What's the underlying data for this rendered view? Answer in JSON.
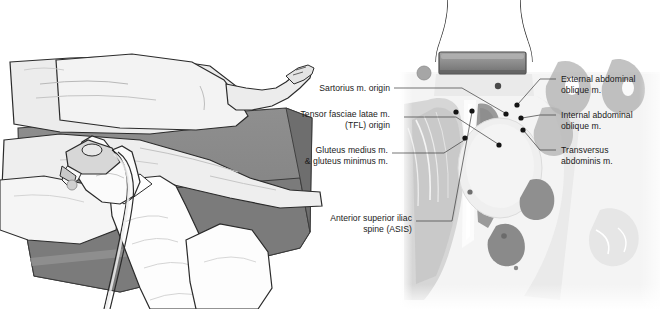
{
  "figure": {
    "background_color": "#ffffff",
    "panels": [
      {
        "id": "left-panel",
        "name": "patient-positioning-illustration",
        "description": "Line-art illustration of a clinician's hand holding an ultrasound transducer against the hip of a patient lying supine on an examination table"
      },
      {
        "id": "right-panel",
        "name": "anatomical-cross-section",
        "description": "Grayscale anatomical cross-section of the lower abdomen/pelvis with a transducer footprint placed on the skin surface"
      }
    ]
  },
  "labels_left": [
    {
      "id": "sartorius",
      "name": "label-sartorius-origin",
      "lines": [
        "Sartorius m. origin"
      ],
      "align": "right"
    },
    {
      "id": "tfl",
      "name": "label-tensor-fasciae-latae-origin",
      "lines": [
        "Tensor fasciae latae m.",
        "(TFL) origin"
      ],
      "align": "right"
    },
    {
      "id": "gluteus",
      "name": "label-gluteus-medius-minimus",
      "lines": [
        "Gluteus medius m.",
        "& gluteus minimus m."
      ],
      "align": "right"
    },
    {
      "id": "asis",
      "name": "label-anterior-superior-iliac-spine",
      "lines": [
        "Anterior superior iliac",
        "spine (ASIS)"
      ],
      "align": "right"
    }
  ],
  "labels_right": [
    {
      "id": "eo",
      "name": "label-external-abdominal-oblique",
      "lines": [
        "External abdominal",
        "oblique m."
      ],
      "align": "left"
    },
    {
      "id": "io",
      "name": "label-internal-abdominal-oblique",
      "lines": [
        "Internal abdominal",
        "oblique m."
      ],
      "align": "left"
    },
    {
      "id": "ta",
      "name": "label-transversus-abdominis",
      "lines": [
        "Transversus",
        "abdominis m."
      ],
      "align": "left"
    }
  ],
  "colors": {
    "background": "#ffffff",
    "text": "#1a1a1a",
    "leader_line": "#3a3a3a",
    "marker_dot": "#141414",
    "outline": "#2b2b2b",
    "skin_light": "#ececec",
    "skin_shade": "#d9d9d9",
    "table_gray": "#8a8a8a",
    "table_gray_dark": "#7b7b7b",
    "transducer_gray": "#8e8e8e",
    "transducer_dark": "#6f6f6f",
    "orientation_marker": "#a6a6a6",
    "tissue_pale": "#efefef",
    "tissue_mid": "#cfcfcf",
    "tissue_dark": "#a8a8a8",
    "tissue_darkest": "#8d8d8d"
  },
  "markers": {
    "orientation_marker_name": "transducer-orientation-marker",
    "transducer_name": "transducer-footprint"
  }
}
